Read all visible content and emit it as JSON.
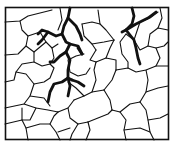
{
  "diagram": {
    "colors": {
      "background": "#ffffff",
      "line": "#111111"
    },
    "frame": {
      "x": 5.5,
      "y": 7.5,
      "w": 163,
      "h": 132,
      "stroke": 1.6
    },
    "thin_cracks": [
      "M5,22 L20,21 L28,16 L40,13 L52,10",
      "M20,21 L22,30 L28,36 L26,46 L18,54 L5,55",
      "M28,36 L40,32",
      "M26,46 L34,52 L34,62 L22,64 L16,72 L14,80 L5,82",
      "M34,62 L42,66 L50,64 L54,58 L52,48 L46,42 L40,32",
      "M34,52 L46,42",
      "M16,72 L26,74 L34,84 L30,96 L24,104 L5,108",
      "M34,84 L44,82 L50,78 L54,68 L50,64",
      "M24,104 L36,108 L48,110 L58,112",
      "M30,96 L44,98 L50,106",
      "M22,108 L22,120 L26,128 L28,140",
      "M26,128 L40,124 L50,124 L56,132 L60,140",
      "M50,124 L54,116 L58,112",
      "M58,112 L68,108 L74,100",
      "M74,100 L84,96 L92,92 L104,90",
      "M68,108 L70,118 L78,124 L88,122",
      "M88,122 L90,130 L86,140",
      "M78,124 L72,134 L70,140",
      "M88,122 L98,118 L108,114 L112,110",
      "M112,110 L110,100 L104,90",
      "M112,110 L120,112 L126,120 L124,130 L126,140",
      "M124,130 L140,128 L150,132 L154,140",
      "M120,112 L130,104 L140,102",
      "M140,102 L146,110 L148,120 L150,132",
      "M148,120 L160,118 L168,114",
      "M140,102 L146,92 L158,88 L168,86",
      "M104,90 L112,80 L116,70",
      "M116,70 L128,68 L136,72 L146,70 L156,66 L168,66",
      "M146,70 L148,80 L146,92",
      "M92,92 L96,80 L94,70 L96,62",
      "M96,62 L106,58 L116,60 L116,70",
      "M106,58 L110,48 L114,40",
      "M114,40 L106,30 L100,24 L92,22 L82,24",
      "M100,24 L98,10",
      "M82,24 L84,36 L92,44 L96,50",
      "M92,44 L104,42 L114,40",
      "M96,50 L90,60 L96,62",
      "M126,34 L134,40 L140,50 L148,46 L156,48 L164,46 L168,42",
      "M126,34 L120,42 L122,54 L128,62 L128,68",
      "M148,46 L150,34 L158,28 L168,30",
      "M156,48 L160,58 L156,66",
      "M158,28 L162,18 L160,8",
      "M134,40 L140,22 L150,18 L158,12",
      "M60,8 L62,20 L58,30",
      "M84,54 L76,56 L68,60 L70,72 L78,76 L86,74 L90,68",
      "M68,82 L76,88 L84,96",
      "M52,48 L58,44",
      "M5,124 L22,120",
      "M36,108 L30,120 L22,120",
      "M58,132 L70,128"
    ],
    "thick_cracks": [
      "M70,8 L68,18 L64,26 L62,34 L66,42 L70,44 L78,46 L82,54",
      "M62,34 L56,36 L48,32 L42,30 L38,34",
      "M48,32 L42,40 L38,44",
      "M70,44 L66,52 L60,56 L56,60 L54,62 L50,62",
      "M82,54 L78,48",
      "M68,18 L76,26 L80,34 L82,40",
      "M66,52 L70,60 L68,70 L68,78 L72,80",
      "M68,78 L62,82 L54,84 L50,92 L48,102",
      "M72,80 L78,82 L84,86",
      "M68,78 L70,86 L68,96",
      "M132,8 L134,16 L132,24 L126,30 L122,32",
      "M126,30 L134,40 L136,48 L138,58 L140,64",
      "M126,30 L136,24 L148,18 L156,12"
    ]
  }
}
